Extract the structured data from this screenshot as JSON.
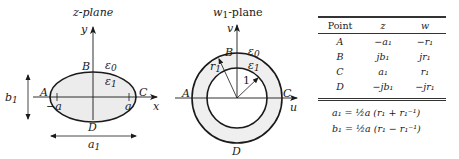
{
  "z_plane": {
    "title": "z-plane",
    "axis_x_label": "x",
    "axis_y_label": "y",
    "points": {
      "A": "A",
      "B": "B",
      "C": "C",
      "D": "D"
    },
    "region_outer": "ε",
    "region_outer_sub": "0",
    "region_inner": "ε",
    "region_inner_sub": "1",
    "focus_left": "−a",
    "focus_right": "a",
    "dim_vertical": "b",
    "dim_vertical_sub": "1",
    "dim_horizontal": "a",
    "dim_horizontal_sub": "1"
  },
  "w_plane": {
    "title_main": "w",
    "title_sub": "1",
    "title_rest": "-plane",
    "axis_u_label": "u",
    "axis_v_label": "v",
    "points": {
      "A": "A",
      "B": "B",
      "C": "C",
      "D": "D"
    },
    "region_outer": "ε",
    "region_outer_sub": "0",
    "region_inner": "ε",
    "region_inner_sub": "1",
    "outer_radius_label": "r",
    "outer_radius_sub": "1",
    "inner_radius_label": "1"
  },
  "table": {
    "headers": [
      "Point",
      "z",
      "w"
    ],
    "rows": [
      {
        "point": "A",
        "z": "−a₁",
        "w": "−r₁"
      },
      {
        "point": "B",
        "z": "jb₁",
        "w": "jr₁"
      },
      {
        "point": "C",
        "z": "a₁",
        "w": "r₁"
      },
      {
        "point": "D",
        "z": "−jb₁",
        "w": "−jr₁"
      }
    ]
  },
  "equations": [
    "a₁ = ½a (r₁ + r₁⁻¹)",
    "b₁ = ½a (r₁ − r₁⁻¹)"
  ],
  "colors": {
    "line": "#1a1a1a",
    "fill_ellipse": "#ececec",
    "fill_annulus": "#efefef"
  }
}
